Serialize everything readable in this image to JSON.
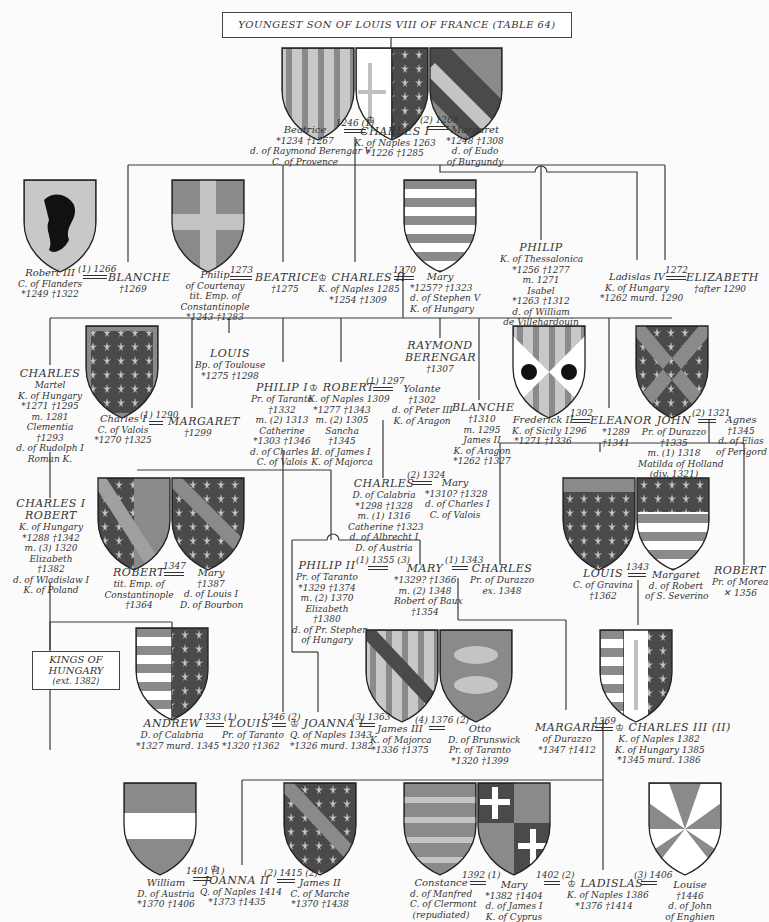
{
  "title_box": "YOUNGEST SON OF LOUIS VIII OF FRANCE (TABLE 64)",
  "kings_box": {
    "line1": "KINGS OF",
    "line2": "HUNGARY",
    "line3": "(ext. 1382)"
  },
  "palette": {
    "background": "#fbfbfb",
    "line": "#3a3a3a",
    "shield_dark": "#4a4a4a",
    "shield_mid": "#8a8a8a",
    "shield_light": "#c4c4c4",
    "shield_white": "#ffffff"
  },
  "people": {
    "beatrice": {
      "name": "Beatrice",
      "l1": "*1234   †1267",
      "l2": "d. of Raymond Berengar V",
      "l3": "C. of Provence"
    },
    "charles1": {
      "crown": "♔",
      "name": "CHARLES I",
      "l1": "K. of Naples 1263",
      "l2": "*1226   †1285"
    },
    "margaret_b": {
      "name": "Margaret",
      "l1": "*1248   †1308",
      "l2": "d. of Eudo",
      "l3": "of Burgundy"
    },
    "robert3": {
      "name": "Robert III",
      "l1": "C. of Flanders",
      "l2": "*1249   †1322"
    },
    "blanche1": {
      "name": "BLANCHE",
      "l1": "†1269"
    },
    "philip_c": {
      "name": "Philip",
      "l1": "of Courtenay",
      "l2": "tit. Emp. of",
      "l3": "Constantinople",
      "l4": "*1243   †1283"
    },
    "beatrice2": {
      "name": "BEATRICE",
      "l1": "†1275"
    },
    "charles2": {
      "crown": "♔",
      "name": "CHARLES II",
      "l1": "K. of Naples 1285",
      "l2": "*1254   †1309"
    },
    "mary_h": {
      "name": "Mary",
      "l1": "*1257?   †1323",
      "l2": "d. of Stephen V",
      "l3": "K. of Hungary"
    },
    "philip_t": {
      "name": "PHILIP",
      "l1": "K. of Thessalonica",
      "l2": "*1256   †1277",
      "l3": "m. 1271",
      "l4": "Isabel",
      "l5": "*1263   †1312",
      "l6": "d. of William",
      "l7": "de Villehardouin"
    },
    "ladislas4": {
      "name": "Ladislas IV",
      "l1": "K. of Hungary",
      "l2": "*1262   murd. 1290"
    },
    "elizabeth": {
      "name": "ELIZABETH",
      "l1": "†after 1290"
    },
    "charles_m": {
      "name": "CHARLES",
      "l1": "Martel",
      "l2": "K. of Hungary",
      "l3": "*1271   †1295",
      "l4": "m. 1281",
      "l5": "Clementia",
      "l6": "†1293",
      "l7": "d. of Rudolph I",
      "l8": "Roman K."
    },
    "charles_v": {
      "name": "Charles I",
      "l1": "C. of Valois",
      "l2": "*1270   †1325"
    },
    "margaret2": {
      "name": "MARGARET",
      "l1": "†1299"
    },
    "louis_t": {
      "name": "LOUIS",
      "l1": "Bp. of Toulouse",
      "l2": "*1275   †1298"
    },
    "philip1": {
      "name": "PHILIP I",
      "l1": "Pr. of Taranto",
      "l2": "†1332",
      "l3": "m. (2) 1313",
      "l4": "Catherine",
      "l5": "*1303   †1346",
      "l6": "d. of Charles I",
      "l7": "C. of Valois"
    },
    "robert_n": {
      "crown": "♔",
      "name": "ROBERT",
      "l1": "K. of Naples 1309",
      "l2": "*1277   †1343",
      "l3": "m. (2) 1305",
      "l4": "Sancha",
      "l5": "†1345",
      "l6": "d. of James I",
      "l7": "K. of Majorca"
    },
    "yolante": {
      "name": "Yolante",
      "l1": "†1302",
      "l2": "d. of Peter III",
      "l3": "K. of Aragon"
    },
    "raymond": {
      "name": "RAYMOND",
      "name2": "BERENGAR",
      "l1": "†1307"
    },
    "blanche2": {
      "name": "BLANCHE",
      "l1": "†1310",
      "l2": "m. 1295",
      "l3": "James II",
      "l4": "K. of Aragon",
      "l5": "*1262   †1327"
    },
    "frederick": {
      "name": "Frederick II",
      "l1": "K. of Sicily 1296",
      "l2": "*1271   †1336"
    },
    "eleanor": {
      "name": "ELEANOR",
      "l1": "*1289",
      "l2": "†1341"
    },
    "john_d": {
      "name": "JOHN",
      "l1": "Pr. of Durazzo",
      "l2": "†1335",
      "l3": "m. (1) 1318",
      "l4": "Matilda of Holland",
      "l5": "(div. 1321)"
    },
    "agnes": {
      "name": "Agnes",
      "l1": "†1345",
      "l2": "d. of Elias",
      "l3": "of Perigord"
    },
    "charles1_r": {
      "name": "CHARLES I",
      "name2": "ROBERT",
      "l1": "K. of Hungary",
      "l2": "*1288   †1342",
      "l3": "m. (3) 1320",
      "l4": "Elizabeth",
      "l5": "†1382",
      "l6": "d. of Wladislaw I",
      "l7": "K. of Poland"
    },
    "robert_c": {
      "name": "ROBERT",
      "l1": "tit. Emp. of",
      "l2": "Constantinople",
      "l3": "†1364"
    },
    "mary_b": {
      "name": "Mary",
      "l1": "†1387",
      "l2": "d. of Louis I",
      "l3": "D. of Bourbon"
    },
    "charles_c": {
      "name": "CHARLES",
      "l1": "D. of Calabria",
      "l2": "*1298   †1328",
      "l3": "m. (1) 1316",
      "l4": "Catherine †1323",
      "l5": "d. of Albrecht I",
      "l6": "D. of Austria"
    },
    "mary_v": {
      "name": "Mary",
      "l1": "*1310?   †1328",
      "l2": "d. of Charles I",
      "l3": "C. of Valois"
    },
    "philip2": {
      "name": "PHILIP II",
      "l1": "Pr. of Taranto",
      "l2": "*1329   †1374",
      "l3": "m. (2) 1370",
      "l4": "Elizabeth",
      "l5": "†1380",
      "l6": "d. of Pr. Stephen",
      "l7": "of Hungary"
    },
    "mary_m": {
      "name": "MARY",
      "l1": "*1329?   †1366",
      "l2": "m. (2) 1348",
      "l3": "Robert of Baux",
      "l4": "†1354"
    },
    "charles_d": {
      "name": "CHARLES",
      "l1": "Pr. of Durazzo",
      "l2": "ex. 1348"
    },
    "louis_g": {
      "name": "LOUIS",
      "l1": "C. of Gravina",
      "l2": "†1362"
    },
    "margaret_s": {
      "name": "Margaret",
      "l1": "d. of Robert",
      "l2": "of S. Severino"
    },
    "robert_m": {
      "name": "ROBERT",
      "l1": "Pr. of Morea",
      "l2": "✕ 1356"
    },
    "andrew": {
      "name": "ANDREW",
      "l1": "D. of Calabria",
      "l2": "*1327   murd. 1345"
    },
    "louis_tar": {
      "name": "LOUIS",
      "l1": "Pr. of Taranto",
      "l2": "*1320   †1362"
    },
    "joanna1": {
      "crown": "♔",
      "name": "JOANNA I",
      "l1": "Q. of Naples 1343",
      "l2": "*1326   murd. 1382"
    },
    "james3": {
      "name": "James III",
      "l1": "K. of Majorca",
      "l2": "*1336   †1375"
    },
    "otto": {
      "name": "Otto",
      "l1": "D. of Brunswick",
      "l2": "Pr. of Taranto",
      "l3": "*1320   †1399"
    },
    "margaret_d": {
      "name": "MARGARET",
      "l1": "of Durazzo",
      "l2": "*1347   †1412"
    },
    "charles3": {
      "crown": "♔",
      "name": "CHARLES III (II)",
      "l1": "K. of Naples 1382",
      "l2": "K. of Hungary 1385",
      "l3": "*1345   murd. 1386"
    },
    "william": {
      "name": "William",
      "l1": "D. of Austria",
      "l2": "*1370   †1406"
    },
    "joanna2": {
      "crown": "♔",
      "name": "JOANNA II",
      "l1": "Q. of Naples 1414",
      "l2": "*1373   †1435"
    },
    "james2": {
      "name": "James II",
      "l1": "C. of Marche",
      "l2": "*1370   †1438"
    },
    "constance": {
      "name": "Constance",
      "l1": "d. of Manfred",
      "l2": "C. of Clermont",
      "l3": "(repudiated)"
    },
    "mary_cy": {
      "name": "Mary",
      "l1": "*1382   †1404",
      "l2": "d. of James I",
      "l3": "K. of Cyprus"
    },
    "ladislas": {
      "crown": "♔",
      "name": "LADISLAS",
      "l1": "K. of Naples 1386",
      "l2": "*1376   †1414"
    },
    "louise": {
      "name": "Louise",
      "l1": "†1446",
      "l2": "d. of John",
      "l3": "of Enghien"
    }
  },
  "marriages": {
    "m1": "1246 (1)",
    "m2": "(2) 1268",
    "m3": "(1) 1266",
    "m4": "1273",
    "m5": "1270",
    "m6": "1272",
    "m7": "(1) 1290",
    "m8": "(1) 1297",
    "m9": "1302",
    "m10": "(2) 1321",
    "m11": "1347",
    "m12": "(2) 1324",
    "m13": "(1) 1355 (3)",
    "m14": "(1) 1343",
    "m15": "1343",
    "m16": "1333 (1)",
    "m17": "1346 (2)",
    "m18": "(3) 1363",
    "m19": "(4) 1376 (2)",
    "m20": "1369",
    "m21": "1401 (1)",
    "m22": "(2) 1415 (2)",
    "m23": "1392 (1)",
    "m24": "1402 (2)",
    "m25": "(3) 1406"
  }
}
